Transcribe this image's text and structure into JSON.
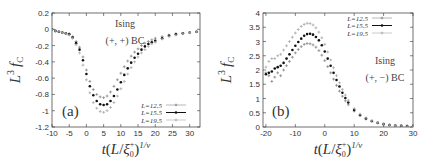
{
  "chart_data": [
    {
      "panel": "(a)",
      "type": "scatter",
      "title": "",
      "annotation_lines": [
        "Ising",
        "(+,+) BC"
      ],
      "panel_label": "(a)",
      "xlabel": "t(L/ξ0+)^(1/ν)",
      "ylabel": "L^3 f_C",
      "xlim": [
        -10,
        33
      ],
      "ylim": [
        -1.2,
        0.2
      ],
      "xticks": [
        -10,
        -5,
        0,
        5,
        10,
        15,
        20,
        25,
        30
      ],
      "yticks": [
        0.2,
        0,
        -0.2,
        -0.4,
        -0.6,
        -0.8,
        -1,
        -1.2
      ],
      "xtick_labels": [
        "-10",
        "-5",
        "0",
        "5",
        "10",
        "15",
        "20",
        "25",
        "30"
      ],
      "ytick_labels": [
        "0.2",
        "0",
        "-0.2",
        "-0.4",
        "-0.6",
        "-0.8",
        "-1",
        "-1.2"
      ],
      "legend_position": "lower right",
      "grid": false,
      "series": [
        {
          "name": "L=12.5",
          "marker": "plus",
          "x": [
            -10,
            -9,
            -8,
            -7,
            -6,
            -5,
            -4,
            -3,
            -2,
            -1,
            0,
            1,
            2,
            3,
            4,
            5,
            6,
            7,
            8,
            9,
            10,
            11,
            12,
            13,
            14,
            15,
            16,
            17,
            18,
            19,
            20,
            22,
            24,
            26,
            28,
            30,
            32
          ],
          "y": [
            0.0,
            -0.02,
            -0.03,
            -0.04,
            -0.05,
            -0.06,
            -0.09,
            -0.15,
            -0.22,
            -0.34,
            -0.5,
            -0.64,
            -0.74,
            -0.8,
            -0.83,
            -0.84,
            -0.82,
            -0.77,
            -0.7,
            -0.62,
            -0.54,
            -0.46,
            -0.39,
            -0.33,
            -0.28,
            -0.24,
            -0.2,
            -0.17,
            -0.15,
            -0.13,
            -0.11,
            -0.09,
            -0.07,
            -0.06,
            -0.05,
            -0.04,
            -0.03
          ]
        },
        {
          "name": "L=15.5",
          "marker": "filled-circle",
          "x": [
            -10,
            -9,
            -8,
            -7,
            -6,
            -5,
            -4,
            -3,
            -2,
            -1,
            0,
            1,
            2,
            3,
            4,
            5,
            6,
            7,
            8,
            9,
            10,
            11,
            12,
            13,
            14,
            15,
            16,
            17,
            18,
            19,
            20,
            22,
            24,
            26,
            28,
            30,
            32
          ],
          "y": [
            0.0,
            -0.02,
            -0.03,
            -0.04,
            -0.05,
            -0.06,
            -0.1,
            -0.17,
            -0.25,
            -0.38,
            -0.55,
            -0.7,
            -0.81,
            -0.88,
            -0.92,
            -0.93,
            -0.92,
            -0.88,
            -0.82,
            -0.74,
            -0.65,
            -0.56,
            -0.48,
            -0.41,
            -0.35,
            -0.3,
            -0.25,
            -0.21,
            -0.18,
            -0.16,
            -0.14,
            -0.11,
            -0.08,
            -0.06,
            -0.05,
            -0.04,
            -0.03
          ]
        },
        {
          "name": "L=19.5",
          "marker": "plus",
          "x": [
            -10,
            -9,
            -8,
            -7,
            -6,
            -5,
            -4,
            -3,
            -2,
            -1,
            0,
            1,
            2,
            3,
            4,
            5,
            6,
            7,
            8,
            9,
            10,
            11,
            12,
            13,
            14,
            15,
            16,
            17,
            18,
            19,
            20,
            22,
            24,
            26,
            28,
            30,
            32
          ],
          "y": [
            0.0,
            -0.02,
            -0.03,
            -0.04,
            -0.05,
            -0.07,
            -0.11,
            -0.19,
            -0.29,
            -0.44,
            -0.62,
            -0.78,
            -0.9,
            -0.97,
            -1.01,
            -1.02,
            -1.0,
            -0.96,
            -0.9,
            -0.82,
            -0.73,
            -0.64,
            -0.55,
            -0.47,
            -0.4,
            -0.34,
            -0.29,
            -0.25,
            -0.21,
            -0.18,
            -0.16,
            -0.12,
            -0.09,
            -0.07,
            -0.05,
            -0.04,
            -0.03
          ]
        }
      ]
    },
    {
      "panel": "(b)",
      "type": "scatter",
      "title": "",
      "annotation_lines": [
        "Ising",
        "(+,−) BC"
      ],
      "panel_label": "(b)",
      "xlabel": "t(L/ξ0+)^(1/ν)",
      "ylabel": "L^3 f_C",
      "xlim": [
        -21,
        30
      ],
      "ylim": [
        0,
        4
      ],
      "xticks": [
        -20,
        -10,
        0,
        10,
        20,
        30
      ],
      "yticks": [
        4,
        3.5,
        3,
        2.5,
        2,
        1.5,
        1,
        0.5,
        0
      ],
      "xtick_labels": [
        "-20",
        "-10",
        "0",
        "10",
        "20",
        "30"
      ],
      "ytick_labels": [
        "4",
        "3.5",
        "3",
        "2.5",
        "2",
        "1.5",
        "1",
        "0.5",
        "0"
      ],
      "legend_position": "upper right",
      "grid": false,
      "series": [
        {
          "name": "L=12.5",
          "marker": "plus",
          "x": [
            -20,
            -19,
            -18,
            -17,
            -16,
            -15,
            -14,
            -13,
            -12,
            -11,
            -10,
            -9,
            -8,
            -7,
            -6,
            -5,
            -4,
            -3,
            -2,
            -1,
            0,
            1,
            2,
            3,
            4,
            5,
            6,
            7,
            8,
            10,
            12,
            14,
            16,
            18,
            20,
            22,
            24,
            26,
            28,
            30
          ],
          "y": [
            1.9,
            1.8,
            1.6,
            1.75,
            1.9,
            1.8,
            2.0,
            2.15,
            2.3,
            2.45,
            2.6,
            2.72,
            2.82,
            2.9,
            2.93,
            2.92,
            2.88,
            2.8,
            2.68,
            2.52,
            2.33,
            2.12,
            1.9,
            1.68,
            1.46,
            1.26,
            1.08,
            0.92,
            0.78,
            0.56,
            0.4,
            0.28,
            0.2,
            0.14,
            0.1,
            0.07,
            0.05,
            0.04,
            0.03,
            0.02
          ]
        },
        {
          "name": "L=15.5",
          "marker": "filled-circle",
          "x": [
            -20,
            -19,
            -18,
            -17,
            -16,
            -15,
            -14,
            -13,
            -12,
            -11,
            -10,
            -9,
            -8,
            -7,
            -6,
            -5,
            -4,
            -3,
            -2,
            -1,
            0,
            1,
            2,
            3,
            4,
            5,
            6,
            7,
            8,
            10,
            12,
            14,
            16,
            18,
            20,
            22,
            24,
            26,
            28,
            30
          ],
          "y": [
            1.85,
            1.9,
            1.95,
            2.05,
            2.1,
            2.15,
            2.25,
            2.4,
            2.55,
            2.7,
            2.85,
            2.98,
            3.1,
            3.2,
            3.26,
            3.27,
            3.24,
            3.16,
            3.04,
            2.87,
            2.65,
            2.4,
            2.15,
            1.9,
            1.65,
            1.42,
            1.2,
            1.02,
            0.86,
            0.6,
            0.42,
            0.3,
            0.21,
            0.15,
            0.1,
            0.07,
            0.05,
            0.04,
            0.03,
            0.02
          ]
        },
        {
          "name": "L=19.5",
          "marker": "plus",
          "x": [
            -20,
            -19,
            -18,
            -17,
            -16,
            -15,
            -14,
            -13,
            -12,
            -11,
            -10,
            -9,
            -8,
            -7,
            -6,
            -5,
            -4,
            -3,
            -2,
            -1,
            0,
            1,
            2,
            3,
            4,
            5,
            6,
            7,
            8,
            10,
            12,
            14,
            16,
            18,
            20,
            22,
            24,
            26,
            28,
            30
          ],
          "y": [
            2.1,
            2.3,
            2.4,
            2.4,
            2.5,
            2.55,
            2.7,
            2.85,
            3.0,
            3.15,
            3.3,
            3.42,
            3.53,
            3.6,
            3.64,
            3.63,
            3.58,
            3.48,
            3.33,
            3.13,
            2.9,
            2.63,
            2.35,
            2.08,
            1.8,
            1.55,
            1.32,
            1.12,
            0.94,
            0.65,
            0.45,
            0.32,
            0.22,
            0.15,
            0.1,
            0.07,
            0.05,
            0.04,
            0.03,
            0.02
          ]
        }
      ]
    }
  ],
  "panels": {
    "a": {
      "label": "(a)",
      "annotation_line1": "Ising",
      "annotation_line2": "(+, +) BC",
      "legend": [
        "L=12.5",
        "L=15.5",
        "L=19.5"
      ]
    },
    "b": {
      "label": "(b)",
      "annotation_line1": "Ising",
      "annotation_line2": "(+, −) BC",
      "legend": [
        "L=12.5",
        "L=15.5",
        "L=19.5"
      ]
    }
  },
  "colors": {
    "L12_5": "#888888",
    "L15_5": "#111111",
    "L19_5": "#aaaaaa",
    "axis": "#333333"
  }
}
